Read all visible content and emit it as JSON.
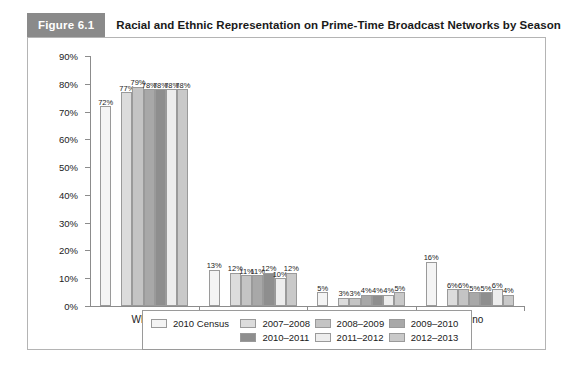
{
  "header": {
    "figure_number": "Figure 6.1",
    "title": "Racial and Ethnic Representation on Prime-Time Broadcast Networks by Season",
    "number_bg": "#8a8a8a",
    "number_color": "#ffffff"
  },
  "chart_data": {
    "type": "bar",
    "title": "Racial and Ethnic Representation on Prime-Time Broadcast Networks by Season",
    "xlabel": "",
    "ylabel": "",
    "ylim": [
      0,
      90
    ],
    "grid": false,
    "legend_position": "bottom",
    "categories": [
      "White",
      "Black",
      "Asian",
      "Latino"
    ],
    "ytick_labels": [
      "0%",
      "10%",
      "20%",
      "30%",
      "40%",
      "50%",
      "60%",
      "70%",
      "80%",
      "90%"
    ],
    "ytick_values": [
      0,
      10,
      20,
      30,
      40,
      50,
      60,
      70,
      80,
      90
    ],
    "series": [
      {
        "name": "2010 Census",
        "color": "#f4f4f4",
        "values": [
          72,
          13,
          5,
          16
        ],
        "labels": [
          "72%",
          "13%",
          "5%",
          "16%"
        ]
      },
      {
        "name": "2007–2008",
        "color": "#dcdcdc",
        "values": [
          77,
          12,
          3,
          6
        ],
        "labels": [
          "77%",
          "12%",
          "3%",
          "6%"
        ]
      },
      {
        "name": "2008–2009",
        "color": "#c4c4c4",
        "values": [
          79,
          11,
          3,
          6
        ],
        "labels": [
          "79%",
          "11%",
          "3%",
          "6%"
        ]
      },
      {
        "name": "2009–2010",
        "color": "#a8a8a8",
        "values": [
          78,
          11,
          4,
          5
        ],
        "labels": [
          "78%",
          "11%",
          "4%",
          "5%"
        ]
      },
      {
        "name": "2010–2011",
        "color": "#8e8e8e",
        "values": [
          78,
          12,
          4,
          5
        ],
        "labels": [
          "78%",
          "12%",
          "4%",
          "5%"
        ]
      },
      {
        "name": "2011–2012",
        "color": "#ededed",
        "values": [
          78,
          10,
          4,
          6
        ],
        "labels": [
          "78%",
          "10%",
          "4%",
          "6%"
        ]
      },
      {
        "name": "2012–2013",
        "color": "#c9c9c9",
        "values": [
          78,
          12,
          5,
          4
        ],
        "labels": [
          "78%",
          "12%",
          "5%",
          "4%"
        ]
      }
    ]
  },
  "legend": {
    "row1": [
      "2010 Census",
      "2007–2008",
      "2008–2009",
      "2009–2010"
    ],
    "row2": [
      "2010–2011",
      "2011–2012",
      "2012–2013"
    ]
  }
}
